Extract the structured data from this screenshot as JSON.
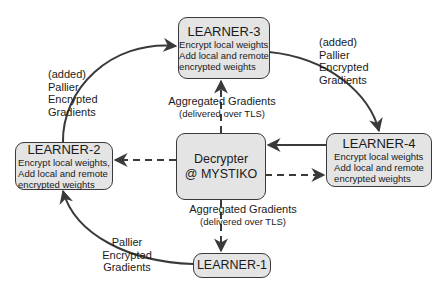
{
  "nodes": {
    "learner3": {
      "title": "LEARNER-3",
      "desc": [
        "Encrypt local weights",
        "Add local and remote",
        "encrypted weights"
      ]
    },
    "learner2": {
      "title": "LEARNER-2",
      "desc": [
        "Encrypt local weights,",
        "Add local and remote",
        "encrypted weights"
      ]
    },
    "learner4": {
      "title": "LEARNER-4",
      "desc": [
        "Encrypt local weights",
        "Add local and remote",
        "encrypted weights"
      ]
    },
    "learner1": {
      "title": "LEARNER-1"
    },
    "decrypter": {
      "title_line1": "Decrypter",
      "title_line2": "@ MYSTIKO"
    }
  },
  "edge_labels": {
    "l2_to_l3": [
      "(added)",
      "Pallier",
      "Encrypted",
      "Gradients"
    ],
    "l3_to_l4": [
      "(added)",
      "Pallier",
      "Encrypted",
      "Gradients"
    ],
    "l1_to_l2": [
      "Pallier",
      "Encrypted",
      "Gradients"
    ],
    "dec_to_l3": {
      "main": "Aggregated Gradients",
      "sub": "(delivered over TLS)"
    },
    "dec_to_l1": {
      "main": "Aggregated Gradients",
      "sub": "(delivered over TLS)"
    }
  },
  "colors": {
    "node_fill": "#e4e4e4",
    "stroke": "#3a3a3a",
    "background": "#ffffff"
  }
}
